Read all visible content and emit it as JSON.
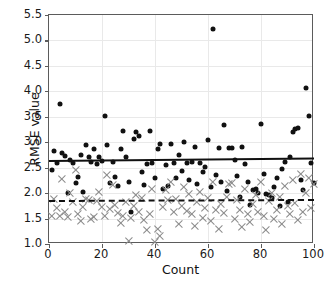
{
  "chart_data": {
    "type": "scatter",
    "title": "",
    "xlabel": "Count",
    "ylabel": "RMSE value",
    "xlim": [
      0,
      100
    ],
    "ylim": [
      1.0,
      5.5
    ],
    "xticks": [
      0,
      20,
      40,
      60,
      80,
      100
    ],
    "yticks": [
      1.0,
      1.5,
      2.0,
      2.5,
      3.0,
      3.5,
      4.0,
      4.5,
      5.0,
      5.5
    ],
    "ytick_labels": [
      "1.0",
      "1.5",
      "2.0",
      "2.5",
      "3.0",
      "3.5",
      "4.0",
      "4.5",
      "5.0",
      "5.5"
    ],
    "xtick_labels": [
      "0",
      "20",
      "40",
      "60",
      "80",
      "100"
    ],
    "grid": true,
    "legend": "none",
    "series": [
      {
        "name": "series-dots",
        "marker": "circle",
        "color": "#111111",
        "points": [
          [
            1,
            2.45
          ],
          [
            2,
            2.82
          ],
          [
            3,
            2.6
          ],
          [
            4,
            3.76
          ],
          [
            5,
            2.78
          ],
          [
            6,
            2.72
          ],
          [
            7,
            2.0
          ],
          [
            8,
            2.66
          ],
          [
            9,
            2.6
          ],
          [
            10,
            2.2
          ],
          [
            11,
            2.32
          ],
          [
            12,
            2.74
          ],
          [
            13,
            2.02
          ],
          [
            14,
            2.94
          ],
          [
            15,
            2.7
          ],
          [
            16,
            2.62
          ],
          [
            17,
            2.86
          ],
          [
            18,
            2.58
          ],
          [
            19,
            2.7
          ],
          [
            20,
            2.64
          ],
          [
            21,
            3.52
          ],
          [
            22,
            2.94
          ],
          [
            23,
            2.2
          ],
          [
            24,
            2.62
          ],
          [
            25,
            2.32
          ],
          [
            26,
            2.14
          ],
          [
            27,
            2.86
          ],
          [
            28,
            3.22
          ],
          [
            29,
            2.7
          ],
          [
            30,
            2.22
          ],
          [
            31,
            1.62
          ],
          [
            32,
            3.06
          ],
          [
            33,
            3.2
          ],
          [
            34,
            3.12
          ],
          [
            35,
            2.42
          ],
          [
            36,
            2.16
          ],
          [
            37,
            2.58
          ],
          [
            38,
            3.23
          ],
          [
            39,
            2.6
          ],
          [
            40,
            2.3
          ],
          [
            41,
            2.86
          ],
          [
            42,
            2.96
          ],
          [
            43,
            2.08
          ],
          [
            44,
            2.56
          ],
          [
            45,
            2.14
          ],
          [
            46,
            2.96
          ],
          [
            47,
            2.6
          ],
          [
            48,
            2.3
          ],
          [
            49,
            2.74
          ],
          [
            50,
            2.44
          ],
          [
            51,
            3.0
          ],
          [
            52,
            2.6
          ],
          [
            53,
            2.26
          ],
          [
            54,
            2.62
          ],
          [
            55,
            2.9
          ],
          [
            56,
            2.18
          ],
          [
            57,
            2.6
          ],
          [
            58,
            2.42
          ],
          [
            59,
            2.52
          ],
          [
            60,
            3.04
          ],
          [
            61,
            2.12
          ],
          [
            62,
            5.22
          ],
          [
            63,
            2.36
          ],
          [
            64,
            2.88
          ],
          [
            65,
            2.22
          ],
          [
            66,
            3.34
          ],
          [
            67,
            2.04
          ],
          [
            68,
            2.88
          ],
          [
            69,
            2.88
          ],
          [
            70,
            2.65
          ],
          [
            71,
            2.34
          ],
          [
            72,
            1.92
          ],
          [
            73,
            2.9
          ],
          [
            74,
            2.58
          ],
          [
            75,
            2.22
          ],
          [
            76,
            1.76
          ],
          [
            77,
            2.06
          ],
          [
            78,
            2.08
          ],
          [
            79,
            2.0
          ],
          [
            80,
            3.36
          ],
          [
            81,
            2.38
          ],
          [
            82,
            1.98
          ],
          [
            83,
            1.96
          ],
          [
            84,
            1.9
          ],
          [
            85,
            2.12
          ],
          [
            86,
            2.3
          ],
          [
            87,
            1.74
          ],
          [
            88,
            2.48
          ],
          [
            89,
            2.62
          ],
          [
            90,
            1.82
          ],
          [
            91,
            2.7
          ],
          [
            92,
            3.2
          ],
          [
            93,
            3.26
          ],
          [
            94,
            3.28
          ],
          [
            95,
            2.26
          ],
          [
            96,
            2.06
          ],
          [
            97,
            4.06
          ],
          [
            98,
            3.52
          ],
          [
            99,
            2.6
          ],
          [
            100,
            2.2
          ]
        ]
      },
      {
        "name": "series-crosses",
        "marker": "x",
        "color": "#8a8a8a",
        "points": [
          [
            1,
            1.56
          ],
          [
            2,
            1.88
          ],
          [
            3,
            1.7
          ],
          [
            4,
            1.56
          ],
          [
            5,
            2.28
          ],
          [
            6,
            1.62
          ],
          [
            7,
            1.54
          ],
          [
            8,
            2.0
          ],
          [
            9,
            1.82
          ],
          [
            10,
            2.46
          ],
          [
            11,
            1.58
          ],
          [
            12,
            1.46
          ],
          [
            13,
            1.72
          ],
          [
            14,
            1.88
          ],
          [
            15,
            1.86
          ],
          [
            16,
            1.5
          ],
          [
            17,
            1.54
          ],
          [
            18,
            1.84
          ],
          [
            19,
            2.02
          ],
          [
            20,
            1.72
          ],
          [
            21,
            1.56
          ],
          [
            22,
            2.36
          ],
          [
            23,
            1.68
          ],
          [
            24,
            2.16
          ],
          [
            25,
            1.76
          ],
          [
            26,
            1.6
          ],
          [
            27,
            1.42
          ],
          [
            28,
            1.56
          ],
          [
            29,
            1.82
          ],
          [
            30,
            1.06
          ],
          [
            31,
            1.52
          ],
          [
            32,
            1.74
          ],
          [
            33,
            1.96
          ],
          [
            34,
            1.62
          ],
          [
            35,
            1.9
          ],
          [
            36,
            1.48
          ],
          [
            37,
            1.28
          ],
          [
            38,
            1.58
          ],
          [
            39,
            2.08
          ],
          [
            40,
            1.04
          ],
          [
            41,
            1.3
          ],
          [
            42,
            1.16
          ],
          [
            43,
            1.72
          ],
          [
            44,
            2.06
          ],
          [
            45,
            1.86
          ],
          [
            46,
            2.22
          ],
          [
            47,
            1.62
          ],
          [
            48,
            1.88
          ],
          [
            49,
            1.4
          ],
          [
            50,
            1.74
          ],
          [
            51,
            2.12
          ],
          [
            52,
            1.64
          ],
          [
            53,
            1.98
          ],
          [
            54,
            1.58
          ],
          [
            55,
            1.36
          ],
          [
            56,
            1.82
          ],
          [
            57,
            2.02
          ],
          [
            58,
            1.52
          ],
          [
            59,
            1.7
          ],
          [
            60,
            1.9
          ],
          [
            61,
            1.46
          ],
          [
            62,
            2.22
          ],
          [
            63,
            1.66
          ],
          [
            64,
            1.3
          ],
          [
            65,
            1.78
          ],
          [
            66,
            1.6
          ],
          [
            67,
            1.92
          ],
          [
            68,
            2.18
          ],
          [
            69,
            2.2
          ],
          [
            70,
            1.5
          ],
          [
            71,
            1.86
          ],
          [
            72,
            1.66
          ],
          [
            73,
            1.34
          ],
          [
            74,
            2.08
          ],
          [
            75,
            1.58
          ],
          [
            76,
            1.44
          ],
          [
            77,
            1.78
          ],
          [
            78,
            1.96
          ],
          [
            79,
            1.62
          ],
          [
            80,
            2.22
          ],
          [
            81,
            1.56
          ],
          [
            82,
            1.28
          ],
          [
            83,
            1.84
          ],
          [
            84,
            2.0
          ],
          [
            85,
            1.5
          ],
          [
            86,
            1.66
          ],
          [
            87,
            1.92
          ],
          [
            88,
            1.4
          ],
          [
            89,
            2.14
          ],
          [
            90,
            1.74
          ],
          [
            91,
            1.58
          ],
          [
            92,
            2.26
          ],
          [
            93,
            1.8
          ],
          [
            94,
            1.48
          ],
          [
            95,
            2.38
          ],
          [
            96,
            1.62
          ],
          [
            97,
            2.0
          ],
          [
            98,
            2.3
          ],
          [
            99,
            1.7
          ],
          [
            100,
            2.18
          ]
        ]
      }
    ],
    "trend_lines": [
      {
        "name": "solid-trend",
        "style": "solid",
        "color": "#111111",
        "x0": 0,
        "y0": 2.65,
        "x1": 100,
        "y1": 2.7
      },
      {
        "name": "dashed-trend",
        "style": "dashed",
        "color": "#111111",
        "x0": 0,
        "y0": 1.87,
        "x1": 100,
        "y1": 1.89
      }
    ]
  }
}
